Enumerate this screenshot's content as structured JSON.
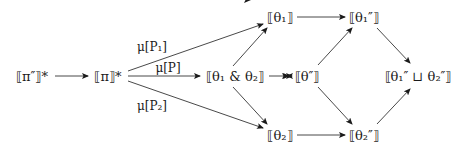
{
  "nodes": [
    {
      "id": "pi_pp_star",
      "label": "⟦π″⟧*",
      "x": 32,
      "y": 76
    },
    {
      "id": "pi_star",
      "label": "⟦π⟧*",
      "x": 108,
      "y": 76
    },
    {
      "id": "theta1",
      "label": "⟦θ₁⟧",
      "x": 280,
      "y": 17
    },
    {
      "id": "theta12",
      "label": "⟦θ₁ & θ₂⟧",
      "x": 244,
      "y": 76
    },
    {
      "id": "theta2",
      "label": "⟦θ₂⟧",
      "x": 280,
      "y": 135
    },
    {
      "id": "thetapp",
      "label": "⟦θ″⟧",
      "x": 307,
      "y": 76
    },
    {
      "id": "theta1pp",
      "label": "⟦θ₁″⟧",
      "x": 364,
      "y": 17
    },
    {
      "id": "theta2pp",
      "label": "⟦θ₂″⟧",
      "x": 364,
      "y": 135
    },
    {
      "id": "join",
      "label": "⟦θ₁″ ⊔ θ₂″⟧",
      "x": 418,
      "y": 76
    }
  ],
  "edges": [
    {
      "from": "pi_pp_star",
      "to": "pi_star",
      "label": ""
    },
    {
      "from": "pi_star",
      "to": "theta1",
      "label": "μ[P₁]"
    },
    {
      "from": "pi_star",
      "to": "theta12",
      "label": "μ[P]"
    },
    {
      "from": "pi_star",
      "to": "theta2",
      "label": "μ[P₂]"
    },
    {
      "from": "theta12",
      "to": "theta1",
      "label": ""
    },
    {
      "from": "theta12",
      "to": "theta2",
      "label": ""
    },
    {
      "from": "theta12",
      "to": "thetapp",
      "label": ""
    },
    {
      "from": "theta1",
      "to": "theta1pp",
      "label": ""
    },
    {
      "from": "theta2",
      "to": "theta2pp",
      "label": ""
    },
    {
      "from": "thetapp",
      "to": "theta1pp",
      "label": ""
    },
    {
      "from": "thetapp",
      "to": "theta2pp",
      "label": ""
    },
    {
      "from": "theta1pp",
      "to": "join",
      "label": ""
    },
    {
      "from": "theta2pp",
      "to": "join",
      "label": ""
    }
  ],
  "edge_labels": {
    "mu_p1": "μ[P₁]",
    "mu_p": "μ[P]",
    "mu_p2": "μ[P₂]"
  },
  "colors": {
    "ink": "#1a1a1a",
    "background": "#ffffff"
  }
}
